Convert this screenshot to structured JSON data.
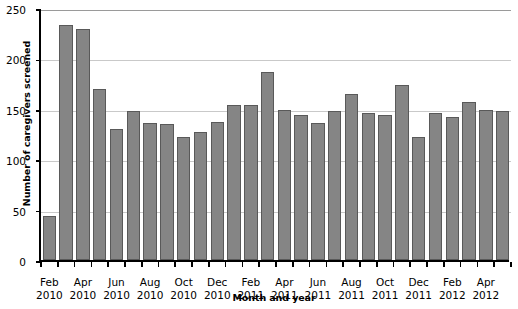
{
  "chart_data": {
    "type": "bar",
    "title": "",
    "xlabel": "Month and year",
    "ylabel": "Number of caregivers screened",
    "ylim": [
      0,
      250
    ],
    "yticks": [
      0,
      50,
      100,
      150,
      200,
      250
    ],
    "ytick_labels": [
      "0",
      "50",
      "100",
      "150",
      "200",
      "250"
    ],
    "grid": true,
    "grid_axis": "y",
    "legend": "none",
    "bar_color": "#858585",
    "bar_edge_color": "#595959",
    "categories": [
      "Feb 2010",
      "Mar 2010",
      "Apr 2010",
      "May 2010",
      "Jun 2010",
      "Jul 2010",
      "Aug 2010",
      "Sep 2010",
      "Oct 2010",
      "Nov 2010",
      "Dec 2010",
      "Jan 2011",
      "Feb 2011",
      "Mar 2011",
      "Apr 2011",
      "May 2011",
      "Jun 2011",
      "Jul 2011",
      "Aug 2011",
      "Sep 2011",
      "Oct 2011",
      "Nov 2011",
      "Dec 2011",
      "Jan 2012",
      "Feb 2012",
      "Mar 2012",
      "Apr 2012",
      "May 2012"
    ],
    "values": [
      44,
      233,
      229,
      170,
      130,
      148,
      136,
      135,
      122,
      127,
      137,
      154,
      154,
      187,
      149,
      144,
      136,
      148,
      165,
      146,
      144,
      174,
      122,
      146,
      142,
      157,
      149,
      148
    ],
    "xtick_positions": [
      "Feb 2010",
      "Apr 2010",
      "Jun 2010",
      "Aug 2010",
      "Oct 2010",
      "Dec 2010",
      "Feb 2011",
      "Apr 2011",
      "Jun 2011",
      "Aug 2011",
      "Oct 2011",
      "Dec 2011",
      "Feb 2012",
      "Apr 2012"
    ],
    "xtick_labels": [
      {
        "month": "Feb",
        "year": "2010"
      },
      {
        "month": "Apr",
        "year": "2010"
      },
      {
        "month": "Jun",
        "year": "2010"
      },
      {
        "month": "Aug",
        "year": "2010"
      },
      {
        "month": "Oct",
        "year": "2010"
      },
      {
        "month": "Dec",
        "year": "2010"
      },
      {
        "month": "Feb",
        "year": "2011"
      },
      {
        "month": "Apr",
        "year": "2011"
      },
      {
        "month": "Jun",
        "year": "2011"
      },
      {
        "month": "Aug",
        "year": "2011"
      },
      {
        "month": "Oct",
        "year": "2011"
      },
      {
        "month": "Dec",
        "year": "2011"
      },
      {
        "month": "Feb",
        "year": "2012"
      },
      {
        "month": "Apr",
        "year": "2012"
      }
    ]
  }
}
